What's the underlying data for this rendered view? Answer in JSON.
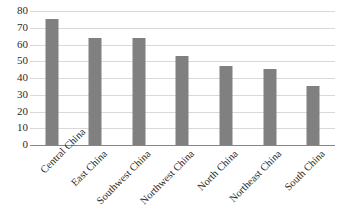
{
  "chart_data": {
    "type": "bar",
    "title": "",
    "subtitle": "",
    "xlabel": "",
    "ylabel": "",
    "ylim": [
      0,
      80
    ],
    "ytick_step": 10,
    "yticks": [
      "80",
      "70",
      "60",
      "50",
      "40",
      "30",
      "20",
      "10",
      "0"
    ],
    "grid": true,
    "legend": "none",
    "categories": [
      "Central China",
      "East China",
      "Southwest China",
      "Northwest China",
      "North China",
      "Northeast China",
      "South China"
    ],
    "values": [
      75,
      64,
      64,
      53,
      47,
      45.5,
      35
    ],
    "bar_color": "#808080",
    "gridline_color": "#d9d9d9",
    "axis_color": "#868686",
    "background_color": "#ffffff"
  }
}
